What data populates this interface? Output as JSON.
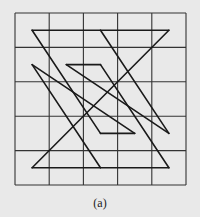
{
  "figure": {
    "caption": "(a)",
    "grid": {
      "rows": 5,
      "cols": 5,
      "x0": 15,
      "y0": 13,
      "x1": 186,
      "y1": 185
    },
    "colors": {
      "background": "#e9e9e9",
      "grid": "#333333",
      "path": "#1a1a1a"
    },
    "points_note": "vertices in cell-center indices [col,row]",
    "segments": [
      [
        [
          0,
          0
        ],
        [
          4,
          0
        ]
      ],
      [
        [
          4,
          0
        ],
        [
          0,
          4
        ]
      ],
      [
        [
          0,
          4
        ],
        [
          4,
          4
        ]
      ],
      [
        [
          4,
          4
        ],
        [
          2,
          1
        ]
      ],
      [
        [
          2,
          1
        ],
        [
          1,
          1
        ]
      ],
      [
        [
          1,
          1
        ],
        [
          4,
          3
        ]
      ],
      [
        [
          4,
          3
        ],
        [
          2,
          0
        ]
      ],
      [
        [
          0,
          0
        ],
        [
          2,
          3
        ]
      ],
      [
        [
          2,
          3
        ],
        [
          3,
          3
        ]
      ],
      [
        [
          3,
          3
        ],
        [
          0,
          1
        ]
      ],
      [
        [
          0,
          1
        ],
        [
          2,
          4
        ]
      ]
    ]
  }
}
